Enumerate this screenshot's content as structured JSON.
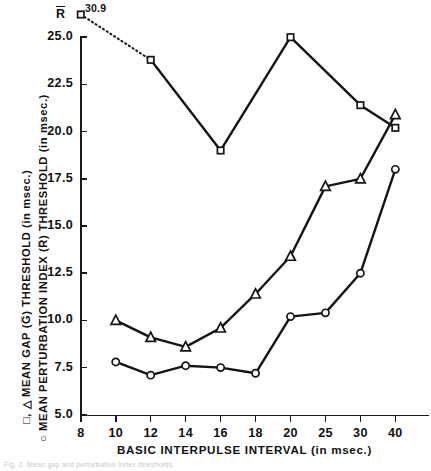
{
  "figure": {
    "rbar_label": "R",
    "annotation_309": "30.9",
    "caption": "Fig. 2. Mean gap and perturbation index thresholds.",
    "xtitle": "BASIC  INTERPULSE  INTERVAL  (in msec.)",
    "ytitle_line1": "□, △  MEAN  GAP  (G̅)  THRESHOLD  (in msec.)",
    "ytitle_line2": "○  MEAN  PERTURBATION  INDEX  (R̅)  THRESHOLD  (in msec.)"
  },
  "chart_data": {
    "type": "line",
    "title": "",
    "xlabel": "BASIC INTERPULSE INTERVAL (in msec.)",
    "ylabel": "MEAN GAP (G) THRESHOLD / MEAN PERTURBATION INDEX (R) THRESHOLD (in msec.)",
    "x_categories": [
      8,
      10,
      12,
      14,
      16,
      18,
      20,
      25,
      30,
      40
    ],
    "x_tick_labels": [
      "8",
      "10",
      "12",
      "14",
      "16",
      "18",
      "20",
      "25",
      "30",
      "40"
    ],
    "y_tick_labels": [
      "5.0",
      "7.5",
      "10.0",
      "12.5",
      "15.0",
      "17.5",
      "20.0",
      "22.5",
      "25.0"
    ],
    "y_tick_values": [
      5.0,
      7.5,
      10.0,
      12.5,
      15.0,
      17.5,
      20.0,
      22.5,
      25.0
    ],
    "ylim": [
      5.0,
      25.0
    ],
    "grid": false,
    "legend": "in-axis-titles",
    "series": [
      {
        "name": "Mean gap threshold (square)",
        "marker": "square",
        "points": [
          {
            "x": 8,
            "y": 30.9,
            "clipped": true,
            "label": "30.9"
          },
          {
            "x": 12,
            "y": 23.8
          },
          {
            "x": 16,
            "y": 19.0
          },
          {
            "x": 20,
            "y": 25.0
          },
          {
            "x": 30,
            "y": 21.4
          },
          {
            "x": 40,
            "y": 20.2
          }
        ],
        "dashed_segment": "8-12"
      },
      {
        "name": "Mean gap threshold (triangle)",
        "marker": "triangle",
        "points": [
          {
            "x": 10,
            "y": 10.0
          },
          {
            "x": 12,
            "y": 9.1
          },
          {
            "x": 14,
            "y": 8.6
          },
          {
            "x": 16,
            "y": 9.6
          },
          {
            "x": 18,
            "y": 11.4
          },
          {
            "x": 20,
            "y": 13.4
          },
          {
            "x": 25,
            "y": 17.1
          },
          {
            "x": 30,
            "y": 17.5
          },
          {
            "x": 40,
            "y": 20.9
          }
        ]
      },
      {
        "name": "Mean perturbation index threshold (circle)",
        "marker": "circle",
        "points": [
          {
            "x": 10,
            "y": 7.8
          },
          {
            "x": 12,
            "y": 7.1
          },
          {
            "x": 14,
            "y": 7.6
          },
          {
            "x": 16,
            "y": 7.5
          },
          {
            "x": 18,
            "y": 7.2
          },
          {
            "x": 20,
            "y": 10.2
          },
          {
            "x": 25,
            "y": 10.4
          },
          {
            "x": 30,
            "y": 12.5
          },
          {
            "x": 40,
            "y": 18.0
          }
        ]
      }
    ]
  }
}
